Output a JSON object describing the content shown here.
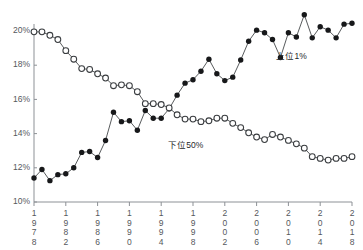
{
  "chart_data": {
    "type": "line",
    "title": "",
    "subtitle": "",
    "xlabel": "",
    "ylabel": "",
    "xlim": [
      1978,
      2018
    ],
    "ylim": [
      10,
      20.8
    ],
    "grid": false,
    "legend_position": "inline-annotations",
    "x": [
      1978,
      1979,
      1980,
      1981,
      1982,
      1983,
      1984,
      1985,
      1986,
      1987,
      1988,
      1989,
      1990,
      1991,
      1992,
      1993,
      1994,
      1995,
      1996,
      1997,
      1998,
      1999,
      2000,
      2001,
      2002,
      2003,
      2004,
      2005,
      2006,
      2007,
      2008,
      2009,
      2010,
      2011,
      2012,
      2013,
      2014,
      2015,
      2016,
      2017,
      2018
    ],
    "x_tick_labels": [
      "1978",
      "1982",
      "1986",
      "1990",
      "1994",
      "1998",
      "2002",
      "2006",
      "2010",
      "2014",
      "2018"
    ],
    "x_tick_values": [
      1978,
      1982,
      1986,
      1990,
      1994,
      1998,
      2002,
      2006,
      2010,
      2014,
      2018
    ],
    "y_tick_labels": [
      "10%",
      "12%",
      "14%",
      "16%",
      "18%",
      "20%"
    ],
    "y_tick_values": [
      10,
      12,
      14,
      16,
      18,
      20
    ],
    "series": [
      {
        "name": "上位1%",
        "marker": "filled-circle",
        "color": "#17181a",
        "annotation": "上位1%",
        "annotation_x": 2010.4,
        "annotation_y": 18.35,
        "values": [
          11.4,
          11.9,
          11.25,
          11.6,
          11.65,
          12.0,
          12.9,
          12.95,
          12.6,
          13.6,
          15.25,
          14.7,
          14.75,
          14.2,
          15.35,
          14.9,
          14.9,
          15.45,
          16.25,
          16.95,
          17.15,
          17.65,
          18.35,
          17.5,
          17.1,
          17.3,
          18.3,
          19.4,
          20.05,
          19.9,
          19.5,
          18.45,
          19.9,
          19.65,
          20.95,
          19.6,
          20.25,
          20.05,
          19.6,
          20.4,
          20.45
        ]
      },
      {
        "name": "下位50%",
        "marker": "open-circle",
        "color": "#ffffff",
        "annotation": "下位50%",
        "annotation_x": 1997.1,
        "annotation_y": 13.15,
        "values": [
          19.95,
          19.95,
          19.75,
          19.5,
          18.85,
          18.35,
          17.8,
          17.75,
          17.5,
          17.25,
          16.8,
          16.85,
          16.8,
          16.45,
          15.75,
          15.75,
          15.7,
          15.5,
          15.1,
          14.85,
          14.85,
          14.7,
          14.75,
          14.9,
          14.9,
          14.6,
          14.35,
          14.05,
          13.8,
          13.65,
          13.95,
          13.8,
          13.6,
          13.4,
          13.15,
          12.65,
          12.55,
          12.45,
          12.55,
          12.55,
          12.65
        ]
      }
    ]
  }
}
